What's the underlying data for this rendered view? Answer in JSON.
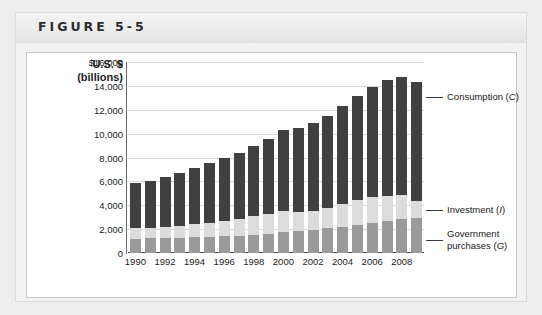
{
  "figure": {
    "label": "FIGURE 5-5"
  },
  "axis": {
    "title_line1": "U.S. $",
    "title_line2": "(billions)"
  },
  "legend": {
    "consumption": "Consumption (C)",
    "investment": "Investment (I)",
    "government_line1": "Government",
    "government_line2": "purchases (G)"
  },
  "chart_data": {
    "type": "bar",
    "stacked": true,
    "title": "FIGURE 5-5",
    "xlabel": "",
    "ylabel": "U.S. $ (billions)",
    "ylim": [
      0,
      16000
    ],
    "ytick_labels": [
      "$16,000",
      "14,000",
      "12,000",
      "10,000",
      "8,000",
      "6,000",
      "4,000",
      "2,000",
      "0"
    ],
    "yticks": [
      16000,
      14000,
      12000,
      10000,
      8000,
      6000,
      4000,
      2000,
      0
    ],
    "grid": true,
    "legend_position": "right-callouts",
    "categories": [
      1990,
      1991,
      1992,
      1993,
      1994,
      1995,
      1996,
      1997,
      1998,
      1999,
      2000,
      2001,
      2002,
      2003,
      2004,
      2005,
      2006,
      2007,
      2008,
      2009
    ],
    "xtick_labels": [
      "1990",
      "1992",
      "1994",
      "1996",
      "1998",
      "2000",
      "2002",
      "2004",
      "2006",
      "2008"
    ],
    "series": [
      {
        "name": "Government purchases (G)",
        "color": "#9a9a9a",
        "values": [
          1180,
          1235,
          1270,
          1290,
          1320,
          1370,
          1415,
          1465,
          1525,
          1630,
          1720,
          1830,
          1960,
          2090,
          2210,
          2360,
          2500,
          2660,
          2880,
          2930
        ]
      },
      {
        "name": "Investment (I)",
        "color": "#dcdcdc",
        "values": [
          880,
          820,
          880,
          960,
          1100,
          1150,
          1260,
          1390,
          1540,
          1660,
          1790,
          1620,
          1570,
          1670,
          1880,
          2080,
          2200,
          2120,
          1940,
          1420
        ]
      },
      {
        "name": "Consumption (C)",
        "color": "#404040",
        "values": [
          3800,
          3980,
          4230,
          4470,
          4740,
          4980,
          5270,
          5550,
          5880,
          6290,
          6760,
          7060,
          7350,
          7700,
          8200,
          8700,
          9200,
          9700,
          9900,
          9960
        ]
      }
    ],
    "totals": [
      5860,
      6035,
      6380,
      6720,
      7160,
      7500,
      7945,
      8405,
      8945,
      9580,
      10270,
      10510,
      10880,
      11460,
      12290,
      13140,
      13900,
      14480,
      14720,
      14310
    ]
  }
}
